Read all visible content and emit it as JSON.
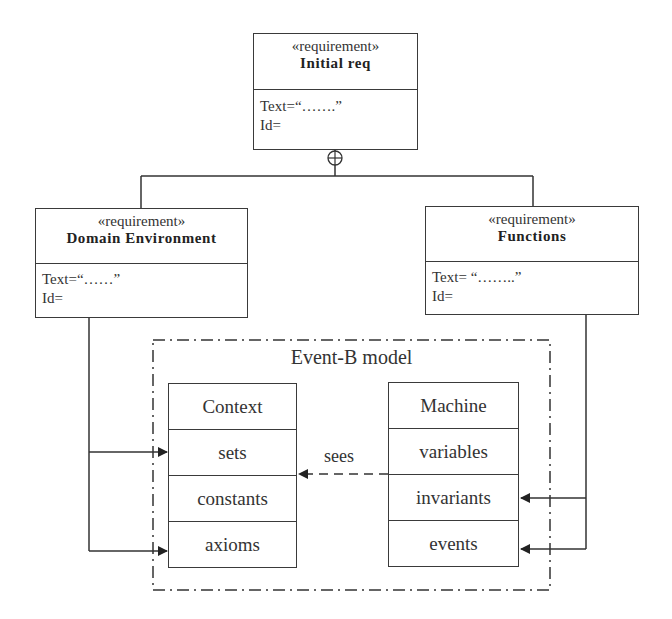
{
  "diagram": {
    "type": "SysML requirement diagram mapped to Event-B model",
    "requirements": [
      {
        "id": "initial",
        "stereotype": "«requirement»",
        "name": "Initial req",
        "text": "Text=“…….”",
        "id_field": "Id="
      },
      {
        "id": "domain",
        "stereotype": "«requirement»",
        "name": "Domain Environment",
        "text": "Text=“……”",
        "id_field": "Id="
      },
      {
        "id": "functions",
        "stereotype": "«requirement»",
        "name": "Functions",
        "text": "Text= “……..”",
        "id_field": "Id="
      }
    ],
    "containment_symbol": "⊕",
    "event_b": {
      "title": "Event-B model",
      "context": {
        "rows": [
          "Context",
          "sets",
          "constants",
          "axioms"
        ]
      },
      "machine": {
        "rows": [
          "Machine",
          "variables",
          "invariants",
          "events"
        ]
      },
      "sees_label": "sees"
    },
    "edges": [
      {
        "from": "Initial req",
        "to": "Domain Environment",
        "kind": "containment"
      },
      {
        "from": "Initial req",
        "to": "Functions",
        "kind": "containment"
      },
      {
        "from": "Domain Environment",
        "to": "sets",
        "kind": "arrow"
      },
      {
        "from": "Domain Environment",
        "to": "axioms",
        "kind": "arrow"
      },
      {
        "from": "Functions",
        "to": "invariants",
        "kind": "arrow"
      },
      {
        "from": "Functions",
        "to": "events",
        "kind": "arrow"
      },
      {
        "from": "Machine",
        "to": "Context",
        "kind": "dashed-arrow",
        "label": "sees"
      }
    ]
  }
}
